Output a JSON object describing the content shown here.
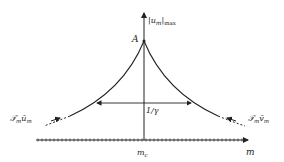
{
  "diagram": {
    "y_axis_label": "|u_m|_max",
    "y_axis_label_main": "|u",
    "y_axis_label_sub": "m",
    "y_axis_label_close": "|",
    "y_axis_label_subscript": "max",
    "peak_label": "A",
    "width_label": "1/γ",
    "x_axis_label": "m",
    "center_label_main": "m",
    "center_label_sub": "c",
    "left_label_main": "𝒯",
    "left_label_sub1": "m",
    "left_label_mid": "ū",
    "left_label_sub2": "m",
    "right_label_main": "𝒯",
    "right_label_sub1": "m",
    "right_label_mid": "v̄",
    "right_label_sub2": "m",
    "colors": {
      "stroke": "#222222",
      "background": "#ffffff"
    }
  }
}
